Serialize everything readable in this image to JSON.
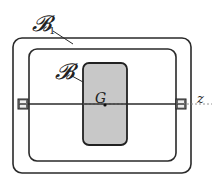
{
  "diagram": {
    "type": "mechanical-schematic",
    "labels": {
      "outer_frame": "𝓑",
      "outer_frame_subscript": "1",
      "inner_body": "𝓑",
      "center": "G",
      "axis": "z"
    },
    "colors": {
      "stroke": "#2a2a2a",
      "body_fill": "#c8c8c8",
      "background": "#ffffff",
      "axis_dash": "#888888"
    }
  }
}
